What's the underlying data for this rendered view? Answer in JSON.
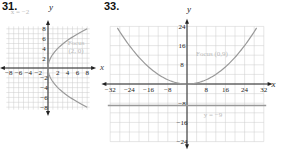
{
  "problems": [
    {
      "number": "31.",
      "label_directrix": "x = −2",
      "label_focus_1": "Focus",
      "label_focus_2": "(2, 0)"
    },
    {
      "number": "33.",
      "label_focus": "Focus (0,9)",
      "label_directrix": "y = −9"
    }
  ],
  "chart_data": [
    {
      "type": "line",
      "title": "31.",
      "xlabel": "",
      "ylabel": "y",
      "xlim": [
        -9,
        9
      ],
      "ylim": [
        -9,
        9
      ],
      "xticks": [
        -8,
        -6,
        -4,
        -2,
        2,
        4,
        6,
        8
      ],
      "yticks": [
        -8,
        -6,
        -4,
        -2,
        2,
        4,
        6,
        8
      ],
      "grid": true,
      "series": [
        {
          "name": "parabola y^2 = 8x",
          "equation": "y^2 = 8x"
        }
      ],
      "annotations": [
        "x = −2",
        "Focus (2, 0)"
      ]
    },
    {
      "type": "line",
      "title": "33.",
      "xlabel": "x",
      "ylabel": "y",
      "xlim": [
        -34,
        34
      ],
      "ylim": [
        -26,
        26
      ],
      "xticks": [
        -32,
        -24,
        -16,
        -8,
        8,
        16,
        24,
        32
      ],
      "yticks": [
        -24,
        -16,
        -8,
        8,
        16,
        24
      ],
      "grid": true,
      "series": [
        {
          "name": "parabola x^2 = 36y",
          "equation": "x^2 = 36y"
        },
        {
          "name": "directrix",
          "equation": "y = -9"
        }
      ],
      "annotations": [
        "Focus (0,9)",
        "y = −9"
      ]
    }
  ]
}
